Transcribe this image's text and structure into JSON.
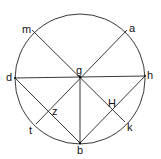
{
  "diagram": {
    "type": "geometric-construction",
    "colors": {
      "stroke": "#222222",
      "text": "#111111",
      "background": "#ffffff"
    },
    "circle": {
      "cx": 80,
      "cy": 79,
      "r": 65
    },
    "points": {
      "g": {
        "x": 80,
        "y": 77,
        "label": "g"
      },
      "d": {
        "x": 15,
        "y": 78,
        "label": "d"
      },
      "h": {
        "x": 145,
        "y": 76,
        "label": "h"
      },
      "b": {
        "x": 80,
        "y": 143,
        "label": "b"
      },
      "m": {
        "x": 32,
        "y": 30,
        "label": "m"
      },
      "a": {
        "x": 127,
        "y": 30,
        "label": "a"
      },
      "t": {
        "x": 36,
        "y": 124,
        "label": "t"
      },
      "k": {
        "x": 125,
        "y": 122,
        "label": "k"
      },
      "z": {
        "x": 48,
        "y": 110,
        "label": "z"
      },
      "H": {
        "x": 112,
        "y": 109,
        "label": "H"
      }
    },
    "segments": [
      [
        "m",
        "k"
      ],
      [
        "a",
        "t"
      ],
      [
        "d",
        "h"
      ],
      [
        "g",
        "b"
      ],
      [
        "d",
        "b"
      ],
      [
        "h",
        "b"
      ]
    ],
    "labels": {
      "m": "m",
      "a": "a",
      "d": "d",
      "g": "g",
      "h": "h",
      "z": "z",
      "H": "H",
      "t": "t",
      "k": "k",
      "b": "b"
    }
  }
}
